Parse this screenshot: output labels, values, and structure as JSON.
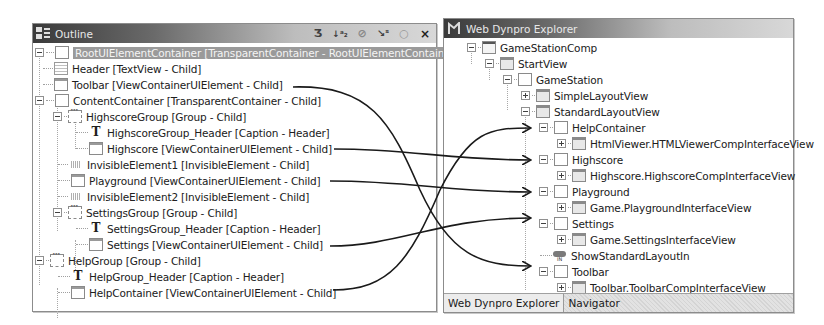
{
  "outline_panel": {
    "title": "Outline",
    "toolbar_icons": [
      "refresh-icon",
      "sort-alpha-icon",
      "filter-icon",
      "wand-icon",
      "circle-icon",
      "close-icon"
    ],
    "toolbar_glyphs": [
      "Ʒ",
      "↓ᵃ₂",
      "⊘",
      "↘ˢ",
      "○",
      "×"
    ],
    "tree": [
      {
        "label": "RootUIElementContainer [TransparentContainer - RootUIElementContainer]",
        "icon": "box",
        "depth": 0,
        "expander": "minus",
        "selected": true
      },
      {
        "label": "Header [TextView - Child]",
        "icon": "textview",
        "depth": 1
      },
      {
        "label": "Toolbar [ViewContainerUIElement - Child]",
        "icon": "win",
        "depth": 1
      },
      {
        "label": "ContentContainer [TransparentContainer - Child]",
        "icon": "box",
        "depth": 1,
        "expander": "minus"
      },
      {
        "label": "HighscoreGroup [Group - Child]",
        "icon": "group",
        "depth": 2,
        "expander": "minus"
      },
      {
        "label": "HighscoreGroup_Header [Caption - Header]",
        "icon": "caption",
        "depth": 3
      },
      {
        "label": "Highscore [ViewContainerUIElement - Child]",
        "icon": "win",
        "depth": 3
      },
      {
        "label": "InvisibleElement1 [InvisibleElement - Child]",
        "icon": "invisible",
        "depth": 2
      },
      {
        "label": "Playground [ViewContainerUIElement - Child]",
        "icon": "win",
        "depth": 2
      },
      {
        "label": "InvisibleElement2 [InvisibleElement - Child]",
        "icon": "invisible",
        "depth": 2
      },
      {
        "label": "SettingsGroup [Group - Child]",
        "icon": "group",
        "depth": 2,
        "expander": "minus"
      },
      {
        "label": "SettingsGroup_Header [Caption - Header]",
        "icon": "caption",
        "depth": 3
      },
      {
        "label": "Settings [ViewContainerUIElement - Child]",
        "icon": "win",
        "depth": 3
      },
      {
        "label": "HelpGroup [Group - Child]",
        "icon": "group",
        "depth": 1,
        "expander": "minus"
      },
      {
        "label": "HelpGroup_Header [Caption - Header]",
        "icon": "caption",
        "depth": 2
      },
      {
        "label": "HelpContainer [ViewContainerUIElement - Child]",
        "icon": "win",
        "depth": 2
      }
    ]
  },
  "wd_panel": {
    "title": "Web Dynpro Explorer",
    "tree": [
      {
        "label": "GameStationComp",
        "icon": "comp",
        "depth": 0,
        "expander": "minus"
      },
      {
        "label": "StartView",
        "icon": "wdwin",
        "depth": 1,
        "expander": "minus"
      },
      {
        "label": "GameStation",
        "icon": "box",
        "depth": 2,
        "expander": "minus"
      },
      {
        "label": "SimpleLayoutView",
        "icon": "wdwin",
        "depth": 3,
        "expander": "plus"
      },
      {
        "label": "StandardLayoutView",
        "icon": "wdwin",
        "depth": 3,
        "expander": "minus"
      },
      {
        "label": "HelpContainer",
        "icon": "box",
        "depth": 4,
        "expander": "minus"
      },
      {
        "label": "HtmlViewer.HTMLViewerCompInterfaceView",
        "icon": "wdwin",
        "depth": 5,
        "expander": "plus"
      },
      {
        "label": "Highscore",
        "icon": "box",
        "depth": 4,
        "expander": "minus"
      },
      {
        "label": "Highscore.HighscoreCompInterfaceView",
        "icon": "wdwin",
        "depth": 5,
        "expander": "plus"
      },
      {
        "label": "Playground",
        "icon": "box",
        "depth": 4,
        "expander": "minus"
      },
      {
        "label": "Game.PlaygroundInterfaceView",
        "icon": "wdwin",
        "depth": 5,
        "expander": "plus"
      },
      {
        "label": "Settings",
        "icon": "box",
        "depth": 4,
        "expander": "minus"
      },
      {
        "label": "Game.SettingsInterfaceView",
        "icon": "wdwin",
        "depth": 5,
        "expander": "plus"
      },
      {
        "label": "ShowStandardLayoutIn",
        "icon": "inplug",
        "depth": 4
      },
      {
        "label": "Toolbar",
        "icon": "box",
        "depth": 4,
        "expander": "minus"
      },
      {
        "label": "Toolbar.ToolbarCompInterfaceView",
        "icon": "wdwin",
        "depth": 5,
        "expander": "plus"
      }
    ],
    "tabs": [
      {
        "label": "Web Dynpro Explorer",
        "active": true
      },
      {
        "label": "Navigator",
        "active": false
      }
    ]
  },
  "mapping_arrows": [
    {
      "from": "Toolbar [ViewContainerUIElement - Child]",
      "to": "Toolbar"
    },
    {
      "from": "Highscore [ViewContainerUIElement - Child]",
      "to": "Highscore"
    },
    {
      "from": "Playground [ViewContainerUIElement - Child]",
      "to": "Playground"
    },
    {
      "from": "Settings [ViewContainerUIElement - Child]",
      "to": "Settings"
    },
    {
      "from": "HelpContainer [ViewContainerUIElement - Child]",
      "to": "HelpContainer"
    }
  ]
}
